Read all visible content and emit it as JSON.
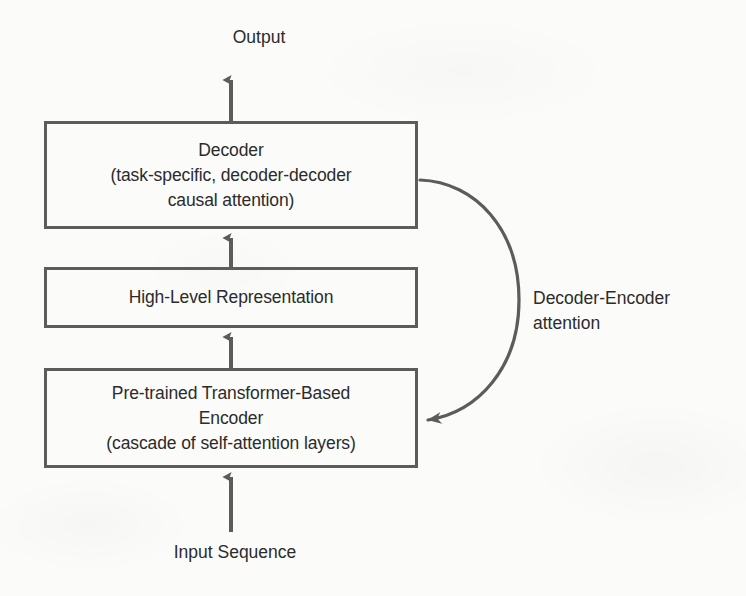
{
  "diagram": {
    "background_color": "#fbfbfa",
    "stroke_color": "#5c5c5c",
    "text_color": "#2b2b2b",
    "nodes": {
      "output": {
        "label": "Output"
      },
      "decoder": {
        "label": "Decoder\n(task-specific, decoder-decoder\ncausal attention)"
      },
      "high_level": {
        "label": "High-Level Representation"
      },
      "encoder": {
        "label": "Pre-trained Transformer-Based\nEncoder\n(cascade of self-attention layers)"
      },
      "input": {
        "label": "Input Sequence"
      }
    },
    "edges": {
      "decoder_encoder_attention": {
        "label": "Decoder-Encoder\nattention"
      }
    }
  }
}
